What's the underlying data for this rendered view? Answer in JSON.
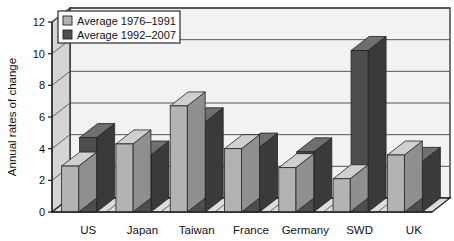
{
  "chart_data": {
    "type": "bar",
    "title": "",
    "xlabel": "",
    "ylabel": "Annual rates of change",
    "ylim": [
      0,
      12
    ],
    "yticks": [
      0,
      2,
      4,
      6,
      8,
      10,
      12
    ],
    "grid": true,
    "legend_position": "top-left",
    "style": "3d-clustered-column",
    "categories": [
      "US",
      "Japan",
      "Taiwan",
      "France",
      "Germany",
      "SWD",
      "UK"
    ],
    "series": [
      {
        "name": "Average 1976–1991",
        "color": "#b3b3b3",
        "values": [
          2.9,
          4.3,
          6.7,
          4.0,
          2.8,
          2.1,
          3.6
        ]
      },
      {
        "name": "Average 1992–2007",
        "color": "#4d4d4d",
        "values": [
          4.7,
          3.6,
          5.7,
          4.1,
          3.8,
          10.2,
          3.2
        ]
      }
    ]
  },
  "legend": {
    "items": [
      {
        "label": "Average 1976–1991",
        "swatch": "#b3b3b3"
      },
      {
        "label": "Average 1992–2007",
        "swatch": "#4d4d4d"
      }
    ]
  },
  "axis": {
    "y_title": "Annual rates of change",
    "y_tick_labels": [
      "0",
      "2",
      "4",
      "6",
      "8",
      "10",
      "12"
    ],
    "x_tick_labels": [
      "US",
      "Japan",
      "Taiwan",
      "France",
      "Germany",
      "SWD",
      "UK"
    ]
  },
  "colors": {
    "plot_background": "#f2f2f2",
    "wall_left": "#d4d4d4",
    "floor": "#dcdcdc",
    "gridline": "#555555",
    "frame": "#2b2b2b",
    "series_light_front": "#b3b3b3",
    "series_light_top": "#cfcfcf",
    "series_light_side": "#8f8f8f",
    "series_dark_front": "#4d4d4d",
    "series_dark_top": "#6f6f6f",
    "series_dark_side": "#3a3a3a"
  }
}
